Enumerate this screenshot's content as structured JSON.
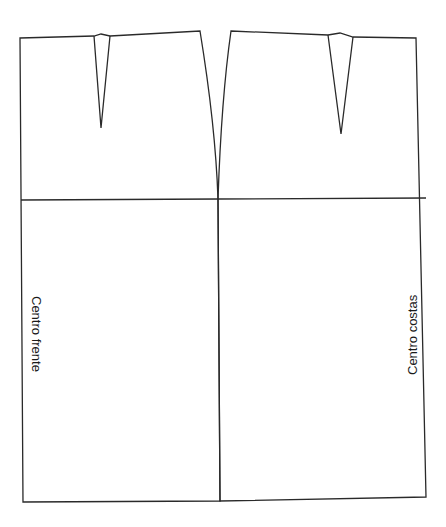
{
  "diagram": {
    "type": "sewing-pattern",
    "colors": {
      "line": "#2a2a2a",
      "background": "#ffffff",
      "text": "#1a1a1a"
    },
    "pieces": [
      {
        "id": "front",
        "label": "Centro frente",
        "darts": 1
      },
      {
        "id": "back",
        "label": "Centro costas",
        "darts": 1
      }
    ]
  },
  "labels": {
    "front_center": "Centro frente",
    "back_center": "Centro costas"
  }
}
